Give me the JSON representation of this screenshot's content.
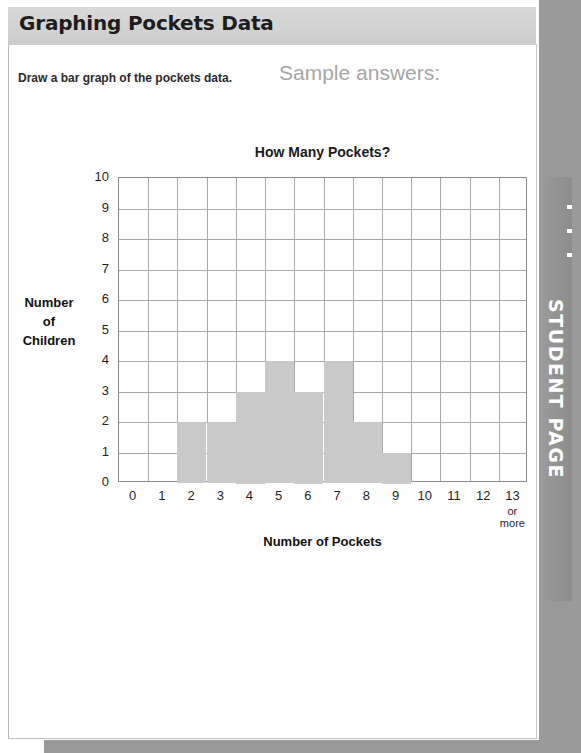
{
  "page": {
    "header_title": "Graphing Pockets Data",
    "instruction": "Draw a bar graph of the pockets data.",
    "sample_answers_note": "Sample answers:",
    "side_tab_label": "STUDENT PAGE"
  },
  "colors": {
    "header_band": "#d2d2d2",
    "bar_fill": "#c9c9c9",
    "grid_line": "#a8a8a8",
    "axis_line": "#8c8c8c",
    "sample_note": "#a6a6a6",
    "side_tab": "#939393"
  },
  "chart_data": {
    "type": "bar",
    "title": "How Many Pockets?",
    "xlabel": "Number of Pockets",
    "ylabel": "Number of Children",
    "ylabel_lines": [
      "Number",
      "of",
      "Children"
    ],
    "categories": [
      "0",
      "1",
      "2",
      "3",
      "4",
      "5",
      "6",
      "7",
      "8",
      "9",
      "10",
      "11",
      "12",
      "13"
    ],
    "x_last_tick_sub": [
      "or",
      "more"
    ],
    "values": [
      0,
      0,
      2,
      2,
      3,
      4,
      3,
      4,
      2,
      1,
      0,
      0,
      0,
      0
    ],
    "xlim": [
      0,
      13
    ],
    "ylim": [
      0,
      10
    ],
    "yticks": [
      "10",
      "9",
      "8",
      "7",
      "6",
      "5",
      "4",
      "3",
      "2",
      "1",
      "0"
    ],
    "grid": true,
    "legend": "none"
  }
}
